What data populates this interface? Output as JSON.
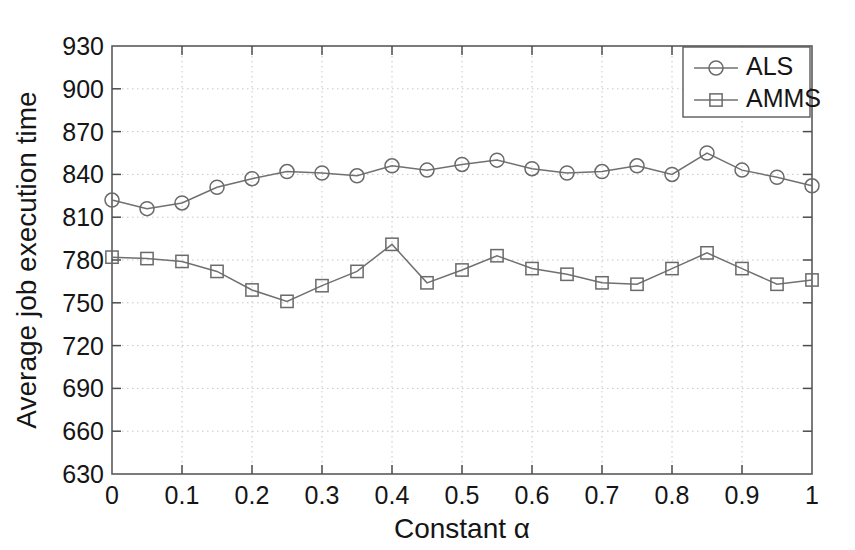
{
  "chart_data": {
    "type": "line",
    "title": "",
    "xlabel": "Constant α",
    "ylabel": "Average job execution time",
    "xlim": [
      0,
      1
    ],
    "ylim": [
      630,
      930
    ],
    "grid": true,
    "legend_position": "top-right",
    "xticks": [
      "0",
      "0.1",
      "0.2",
      "0.3",
      "0.4",
      "0.5",
      "0.6",
      "0.7",
      "0.8",
      "0.9",
      "1"
    ],
    "xtick_values": [
      0,
      0.1,
      0.2,
      0.3,
      0.4,
      0.5,
      0.6,
      0.7,
      0.8,
      0.9,
      1
    ],
    "yticks": [
      "630",
      "660",
      "690",
      "720",
      "750",
      "780",
      "810",
      "840",
      "870",
      "900",
      "930"
    ],
    "ytick_values": [
      630,
      660,
      690,
      720,
      750,
      780,
      810,
      840,
      870,
      900,
      930
    ],
    "x": [
      0,
      0.05,
      0.1,
      0.15,
      0.2,
      0.25,
      0.3,
      0.35,
      0.4,
      0.45,
      0.5,
      0.55,
      0.6,
      0.65,
      0.7,
      0.75,
      0.8,
      0.85,
      0.9,
      0.95,
      1
    ],
    "series": [
      {
        "name": "ALS",
        "marker": "circle",
        "color": "#6a6a6a",
        "values": [
          822,
          816,
          820,
          831,
          837,
          842,
          841,
          839,
          846,
          843,
          847,
          850,
          844,
          841,
          842,
          846,
          840,
          855,
          843,
          838,
          832
        ]
      },
      {
        "name": "AMMS",
        "marker": "square",
        "color": "#6a6a6a",
        "values": [
          782,
          781,
          779,
          772,
          759,
          751,
          762,
          772,
          791,
          764,
          773,
          783,
          774,
          770,
          764,
          763,
          774,
          785,
          774,
          763,
          766
        ]
      }
    ]
  },
  "legend": {
    "entries": [
      {
        "label": "ALS",
        "marker": "circle"
      },
      {
        "label": "AMMS",
        "marker": "square"
      }
    ]
  }
}
